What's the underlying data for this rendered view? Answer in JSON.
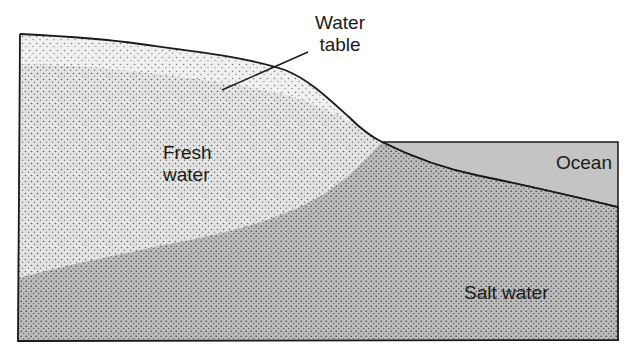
{
  "diagram": {
    "type": "cross-section",
    "labels": {
      "water_table": "Water\ntable",
      "fresh_water": "Fresh\nwater",
      "ocean": "Ocean",
      "salt_water": "Salt water"
    },
    "colors": {
      "unsaturated_zone": "#f4f4f4",
      "fresh_water": "#e6e6e6",
      "salt_water": "#bdbdbd",
      "ocean": "#c4c4c4",
      "outline": "#1a1a1a",
      "stipple": "#555555"
    }
  }
}
